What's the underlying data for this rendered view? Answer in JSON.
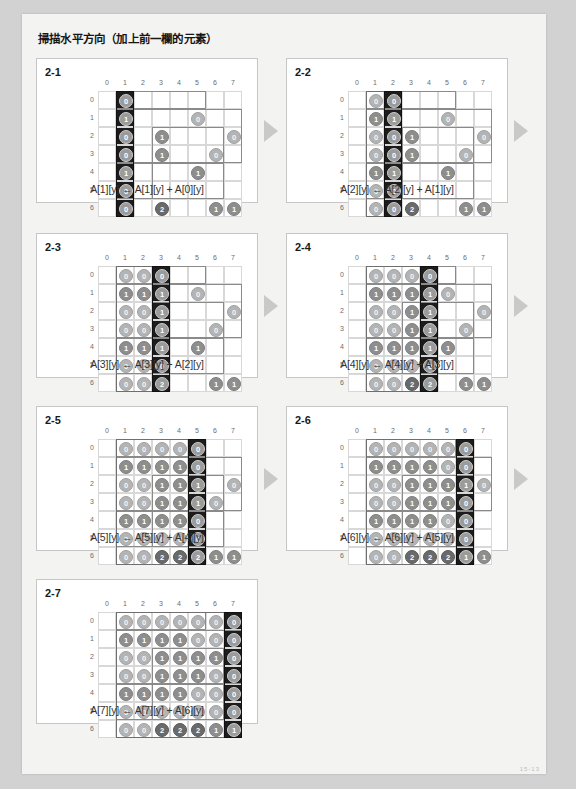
{
  "page": {
    "title": "掃描水平方向（加上前一欄的元素）",
    "footer_code": "15-13"
  },
  "matrix": {
    "col_headers": [
      "0",
      "1",
      "2",
      "3",
      "4",
      "5",
      "6",
      "7"
    ],
    "row_headers": [
      "0",
      "1",
      "2",
      "3",
      "4",
      "5",
      "6"
    ],
    "rows": 7,
    "cols": 8
  },
  "colors": {
    "page_bg": "#d2d2d2",
    "sheet_bg": "#f3f3f1",
    "panel_bg": "#ffffff",
    "panel_border": "#c6c6c6",
    "active_column": "#1c1c1c",
    "arrow": "#c9c9c9",
    "disc_light": "#b4b4b4",
    "disc_mid": "#8e8e8e",
    "disc_dark": "#6a6a6a"
  },
  "arrow_icon": "play-triangle-icon",
  "panels": [
    {
      "id": "panel-2-1",
      "label": "2-1",
      "formula": "A[1][y] ← A[1][y] + A[0][y]",
      "active_col": 1,
      "prev_col": null,
      "values": [
        [
          null,
          0,
          null,
          null,
          null,
          null,
          null,
          null
        ],
        [
          null,
          1,
          null,
          null,
          null,
          0,
          null,
          null
        ],
        [
          null,
          0,
          null,
          1,
          null,
          null,
          null,
          0
        ],
        [
          null,
          0,
          null,
          1,
          null,
          null,
          0,
          null
        ],
        [
          null,
          1,
          null,
          null,
          null,
          1,
          null,
          null
        ],
        [
          null,
          0,
          null,
          null,
          null,
          null,
          null,
          null
        ],
        [
          null,
          0,
          null,
          2,
          null,
          null,
          1,
          1
        ]
      ]
    },
    {
      "id": "panel-2-2",
      "label": "2-2",
      "formula": "A[2][y] ← A[2][y] + A[1][y]",
      "active_col": 2,
      "prev_col": 1,
      "values": [
        [
          null,
          0,
          0,
          null,
          null,
          null,
          null,
          null
        ],
        [
          null,
          1,
          1,
          null,
          null,
          0,
          null,
          null
        ],
        [
          null,
          0,
          0,
          1,
          null,
          null,
          null,
          0
        ],
        [
          null,
          0,
          0,
          1,
          null,
          null,
          0,
          null
        ],
        [
          null,
          1,
          1,
          null,
          null,
          1,
          null,
          null
        ],
        [
          null,
          0,
          0,
          null,
          null,
          null,
          null,
          null
        ],
        [
          null,
          0,
          0,
          2,
          null,
          null,
          1,
          1
        ]
      ]
    },
    {
      "id": "panel-2-3",
      "label": "2-3",
      "formula": "A[3][y] ← A[3][y] + A[2][y]",
      "active_col": 3,
      "prev_col": 2,
      "values": [
        [
          null,
          0,
          0,
          0,
          null,
          null,
          null,
          null
        ],
        [
          null,
          1,
          1,
          1,
          null,
          0,
          null,
          null
        ],
        [
          null,
          0,
          0,
          1,
          null,
          null,
          null,
          0
        ],
        [
          null,
          0,
          0,
          1,
          null,
          null,
          0,
          null
        ],
        [
          null,
          1,
          1,
          1,
          null,
          1,
          null,
          null
        ],
        [
          null,
          0,
          0,
          0,
          null,
          null,
          null,
          null
        ],
        [
          null,
          0,
          0,
          2,
          null,
          null,
          1,
          1
        ]
      ]
    },
    {
      "id": "panel-2-4",
      "label": "2-4",
      "formula": "A[4][y] ← A[4][y] + A[3][y]",
      "active_col": 4,
      "prev_col": 3,
      "values": [
        [
          null,
          0,
          0,
          0,
          0,
          null,
          null,
          null
        ],
        [
          null,
          1,
          1,
          1,
          1,
          0,
          null,
          null
        ],
        [
          null,
          0,
          0,
          1,
          1,
          null,
          null,
          0
        ],
        [
          null,
          0,
          0,
          1,
          1,
          null,
          0,
          null
        ],
        [
          null,
          1,
          1,
          1,
          1,
          1,
          null,
          null
        ],
        [
          null,
          0,
          0,
          0,
          0,
          null,
          null,
          null
        ],
        [
          null,
          0,
          0,
          2,
          2,
          null,
          1,
          1
        ]
      ]
    },
    {
      "id": "panel-2-5",
      "label": "2-5",
      "formula": "A[5][y] ← A[5][y] + A[4][y]",
      "active_col": 5,
      "prev_col": 4,
      "values": [
        [
          null,
          0,
          0,
          0,
          0,
          0,
          null,
          null
        ],
        [
          null,
          1,
          1,
          1,
          1,
          0,
          null,
          null
        ],
        [
          null,
          0,
          0,
          1,
          1,
          1,
          null,
          0
        ],
        [
          null,
          0,
          0,
          1,
          1,
          1,
          0,
          null
        ],
        [
          null,
          1,
          1,
          1,
          1,
          0,
          null,
          null
        ],
        [
          null,
          0,
          0,
          0,
          0,
          0,
          null,
          null
        ],
        [
          null,
          0,
          0,
          2,
          2,
          2,
          1,
          1
        ]
      ]
    },
    {
      "id": "panel-2-6",
      "label": "2-6",
      "formula": "A[6][y] ← A[6][y] + A[5][y]",
      "active_col": 6,
      "prev_col": 5,
      "values": [
        [
          null,
          0,
          0,
          0,
          0,
          0,
          0,
          null
        ],
        [
          null,
          1,
          1,
          1,
          1,
          0,
          0,
          null
        ],
        [
          null,
          0,
          0,
          1,
          1,
          1,
          1,
          0
        ],
        [
          null,
          0,
          0,
          1,
          1,
          1,
          0,
          null
        ],
        [
          null,
          1,
          1,
          1,
          1,
          0,
          0,
          null
        ],
        [
          null,
          0,
          0,
          0,
          0,
          0,
          0,
          null
        ],
        [
          null,
          0,
          0,
          2,
          2,
          2,
          1,
          1
        ]
      ]
    },
    {
      "id": "panel-2-7",
      "label": "2-7",
      "formula": "A[7][y] ← A[7][y] + A[6][y]",
      "active_col": 7,
      "prev_col": 6,
      "values": [
        [
          null,
          0,
          0,
          0,
          0,
          0,
          0,
          0
        ],
        [
          null,
          1,
          1,
          1,
          1,
          0,
          0,
          0
        ],
        [
          null,
          0,
          0,
          1,
          1,
          1,
          1,
          0
        ],
        [
          null,
          0,
          0,
          1,
          1,
          1,
          0,
          0
        ],
        [
          null,
          1,
          1,
          1,
          1,
          0,
          0,
          0
        ],
        [
          null,
          0,
          0,
          0,
          0,
          0,
          0,
          0
        ],
        [
          null,
          0,
          0,
          2,
          2,
          2,
          1,
          1
        ]
      ]
    }
  ]
}
